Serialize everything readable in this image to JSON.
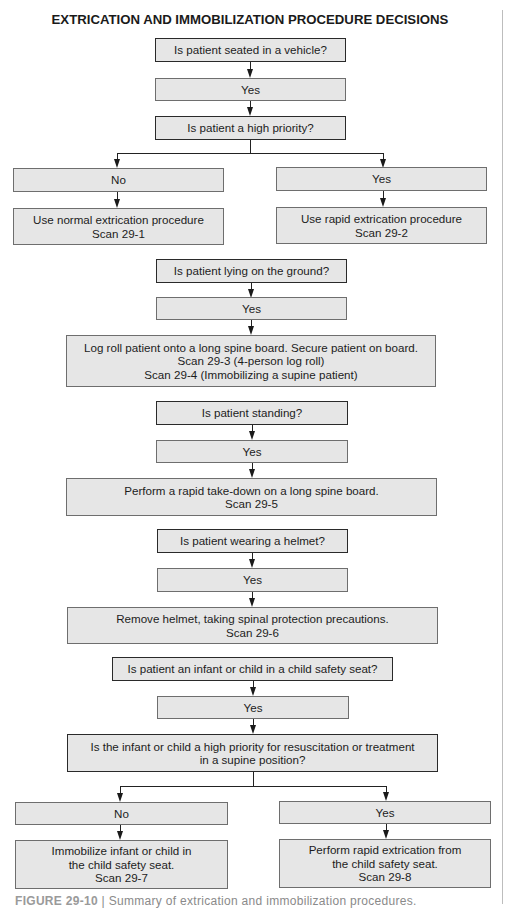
{
  "title": "EXTRICATION AND IMMOBILIZATION PROCEDURE DECISIONS",
  "nodes": {
    "q_seated": {
      "type": "question",
      "lines": [
        "Is patient seated in a vehicle?"
      ]
    },
    "a_seated_yes": {
      "type": "answer",
      "lines": [
        "Yes"
      ]
    },
    "q_high_priority": {
      "type": "question",
      "lines": [
        "Is patient a high priority?"
      ]
    },
    "a_priority_no": {
      "type": "answer",
      "lines": [
        "No"
      ]
    },
    "a_priority_yes": {
      "type": "answer",
      "lines": [
        "Yes"
      ]
    },
    "act_normal": {
      "type": "action",
      "lines": [
        "Use normal extrication procedure",
        "Scan 29-1"
      ]
    },
    "act_rapid": {
      "type": "action",
      "lines": [
        "Use rapid extrication procedure",
        "Scan 29-2"
      ]
    },
    "q_lying": {
      "type": "question",
      "lines": [
        "Is patient lying on the ground?"
      ]
    },
    "a_lying_yes": {
      "type": "answer",
      "lines": [
        "Yes"
      ]
    },
    "act_logroll": {
      "type": "action",
      "lines": [
        "Log roll patient onto a long spine board. Secure patient on board.",
        "Scan 29-3 (4-person log roll)",
        "Scan 29-4 (Immobilizing a supine patient)"
      ]
    },
    "q_standing": {
      "type": "question",
      "lines": [
        "Is patient standing?"
      ]
    },
    "a_standing_yes": {
      "type": "answer",
      "lines": [
        "Yes"
      ]
    },
    "act_takedown": {
      "type": "action",
      "lines": [
        "Perform a rapid take-down on a long spine board.",
        "Scan 29-5"
      ]
    },
    "q_helmet": {
      "type": "question",
      "lines": [
        "Is patient wearing a helmet?"
      ]
    },
    "a_helmet_yes": {
      "type": "answer",
      "lines": [
        "Yes"
      ]
    },
    "act_helmet": {
      "type": "action",
      "lines": [
        "Remove helmet, taking spinal protection precautions.",
        "Scan 29-6"
      ]
    },
    "q_infant": {
      "type": "question",
      "lines": [
        "Is patient an infant or child in a child safety seat?"
      ]
    },
    "a_infant_yes": {
      "type": "answer",
      "lines": [
        "Yes"
      ]
    },
    "q_infant_priority": {
      "type": "question",
      "lines": [
        "Is the infant or child a high priority for resuscitation or treatment",
        "in a supine position?"
      ]
    },
    "a_infant_no": {
      "type": "answer",
      "lines": [
        "No"
      ]
    },
    "a_infant_priority_yes": {
      "type": "answer",
      "lines": [
        "Yes"
      ]
    },
    "act_immobilize_seat": {
      "type": "action",
      "lines": [
        "Immobilize infant or child in",
        "the child safety seat.",
        "Scan 29-7"
      ]
    },
    "act_rapid_seat": {
      "type": "action",
      "lines": [
        "Perform rapid extrication from",
        "the child safety seat.",
        "Scan 29-8"
      ]
    }
  },
  "caption": {
    "label": "FIGURE 29-10",
    "text": "Summary of extrication and immobilization procedures."
  },
  "colors": {
    "box_fill": "#e6e6e6",
    "question_border": "#2a2a2a",
    "answer_border": "#6e6e6e",
    "line": "#222222"
  }
}
